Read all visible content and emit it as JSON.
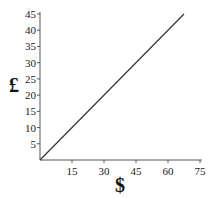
{
  "chart_data": {
    "type": "line",
    "title": "",
    "xlabel": "$",
    "ylabel": "£",
    "xlim": [
      0,
      75
    ],
    "ylim": [
      0,
      45
    ],
    "xticks": [
      15,
      30,
      45,
      60,
      75
    ],
    "yticks": [
      5,
      10,
      15,
      20,
      25,
      30,
      35,
      40,
      45
    ],
    "grid": false,
    "legend": null,
    "series": [
      {
        "name": "conversion",
        "x": [
          0,
          67.5
        ],
        "y": [
          0,
          45
        ]
      }
    ]
  },
  "colors": {
    "line": "#333333",
    "axis": "#555555"
  }
}
